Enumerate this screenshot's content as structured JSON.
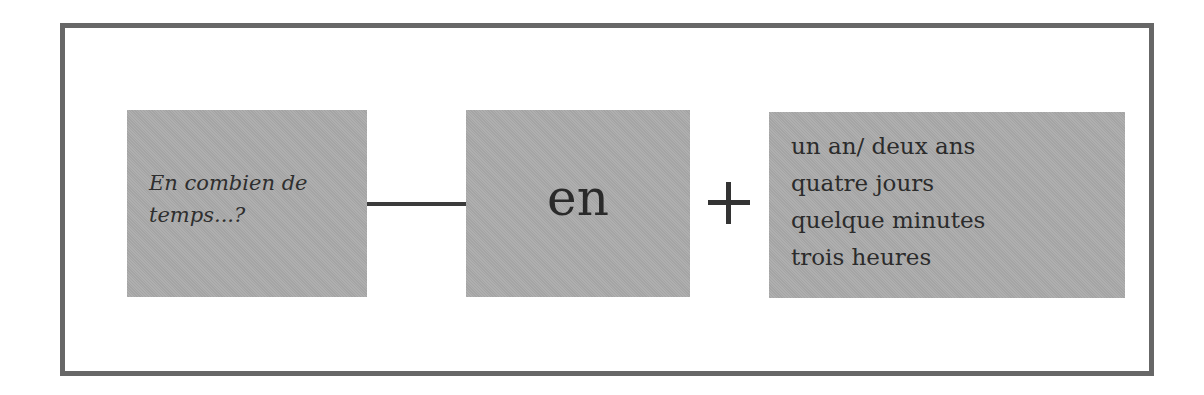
{
  "diagram": {
    "question": {
      "lines": [
        "En combien de",
        "temps...?"
      ]
    },
    "connector": "line",
    "preposition": "en",
    "operator": "+",
    "durations": [
      "un an/ deux ans",
      "quatre jours",
      "quelque minutes",
      "trois heures"
    ]
  },
  "colors": {
    "frame_border": "#676767",
    "box_fill": "#ababab",
    "text": "#2b2b2b",
    "background": "#ffffff"
  }
}
